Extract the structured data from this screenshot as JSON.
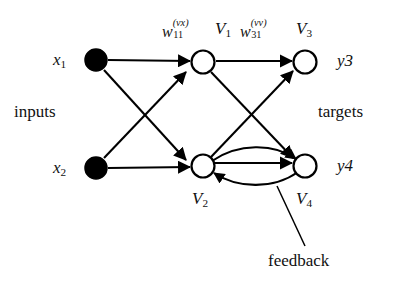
{
  "figure": {
    "type": "neural-network-diagram",
    "background_color": "#ffffff",
    "stroke_color": "#000000",
    "input_node_fill": "#000000",
    "hidden_node_fill": "#ffffff"
  },
  "captions": {
    "inputs": "inputs",
    "targets": "targets",
    "feedback": "feedback"
  },
  "inputs": [
    {
      "id": "x1",
      "symbol": "x",
      "index": "1"
    },
    {
      "id": "x2",
      "symbol": "x",
      "index": "2"
    }
  ],
  "units": [
    {
      "id": "V1",
      "symbol": "V",
      "index": "1"
    },
    {
      "id": "V2",
      "symbol": "V",
      "index": "2"
    },
    {
      "id": "V3",
      "symbol": "V",
      "index": "3"
    },
    {
      "id": "V4",
      "symbol": "V",
      "index": "4"
    }
  ],
  "targets": [
    {
      "id": "y3",
      "label": "y3",
      "symbol": "y",
      "index": "3"
    },
    {
      "id": "y4",
      "label": "y4",
      "symbol": "y",
      "index": "4"
    }
  ],
  "weights": [
    {
      "id": "w_vx_11",
      "symbol": "w",
      "superscript": "(vx)",
      "subscript": "11",
      "describes": "input-to-unit weight"
    },
    {
      "id": "w_vv_31",
      "symbol": "w",
      "superscript": "(vv)",
      "subscript": "31",
      "describes": "unit-to-unit weight"
    }
  ],
  "edges": [
    {
      "from": "x1",
      "to": "V1"
    },
    {
      "from": "x1",
      "to": "V2"
    },
    {
      "from": "x2",
      "to": "V1"
    },
    {
      "from": "x2",
      "to": "V2"
    },
    {
      "from": "V1",
      "to": "V3"
    },
    {
      "from": "V1",
      "to": "V4"
    },
    {
      "from": "V2",
      "to": "V3"
    },
    {
      "from": "V2",
      "to": "V4"
    },
    {
      "from": "V2",
      "to": "V4",
      "style": "arc-upper",
      "group": "feedback"
    },
    {
      "from": "V4",
      "to": "V2",
      "style": "arc-lower",
      "group": "feedback"
    }
  ]
}
